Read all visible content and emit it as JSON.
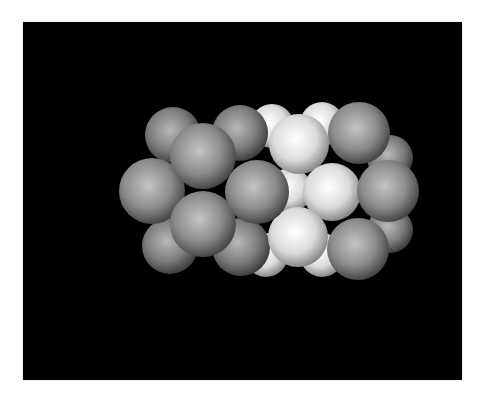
{
  "viewport": {
    "background": "#000000",
    "x": 23,
    "y": 22,
    "width": 439,
    "height": 358
  },
  "molecule": {
    "description": "space-filling cluster of spheres rendered on black background",
    "colors": {
      "gray": {
        "light": "#c4c4c4",
        "mid": "#8c8c8c",
        "dark": "#3a3a3a"
      },
      "white": {
        "light": "#ffffff",
        "mid": "#dcdcdc",
        "dark": "#7a7a7a"
      },
      "gray_back": {
        "light": "#b8b8b8",
        "mid": "#7e7e7e",
        "dark": "#333333"
      }
    },
    "atoms": [
      {
        "id": "back-white-top-left",
        "type": "white",
        "cx": 272,
        "cy": 126,
        "r": 22
      },
      {
        "id": "back-white-top-right",
        "type": "white",
        "cx": 322,
        "cy": 124,
        "r": 22
      },
      {
        "id": "back-white-bot-left",
        "type": "white",
        "cx": 266,
        "cy": 255,
        "r": 22
      },
      {
        "id": "back-white-bot-right",
        "type": "white",
        "cx": 322,
        "cy": 255,
        "r": 22
      },
      {
        "id": "back-white-center",
        "type": "white",
        "cx": 290,
        "cy": 190,
        "r": 22
      },
      {
        "id": "back-right-top",
        "type": "gray_back",
        "cx": 390,
        "cy": 158,
        "r": 23
      },
      {
        "id": "back-right-bottom",
        "type": "gray_back",
        "cx": 390,
        "cy": 230,
        "r": 23
      },
      {
        "id": "back-top-left",
        "type": "gray_back",
        "cx": 173,
        "cy": 135,
        "r": 28
      },
      {
        "id": "back-top-mid",
        "type": "gray_back",
        "cx": 240,
        "cy": 133,
        "r": 28
      },
      {
        "id": "back-bottom-left",
        "type": "gray_back",
        "cx": 170,
        "cy": 246,
        "r": 28
      },
      {
        "id": "back-bottom-mid",
        "type": "gray_back",
        "cx": 241,
        "cy": 247,
        "r": 29
      },
      {
        "id": "left-middle",
        "type": "gray",
        "cx": 152,
        "cy": 191,
        "r": 33
      },
      {
        "id": "white-top",
        "type": "white",
        "cx": 299,
        "cy": 144,
        "r": 30
      },
      {
        "id": "white-middle-right",
        "type": "white",
        "cx": 332,
        "cy": 192,
        "r": 29
      },
      {
        "id": "white-bottom",
        "type": "white",
        "cx": 298,
        "cy": 237,
        "r": 30
      },
      {
        "id": "gray-top-right",
        "type": "gray",
        "cx": 359,
        "cy": 133,
        "r": 31
      },
      {
        "id": "gray-right",
        "type": "gray",
        "cx": 388,
        "cy": 191,
        "r": 31
      },
      {
        "id": "gray-bottom-right",
        "type": "gray",
        "cx": 358,
        "cy": 249,
        "r": 31
      },
      {
        "id": "front-top-left",
        "type": "gray",
        "cx": 203,
        "cy": 156,
        "r": 33
      },
      {
        "id": "front-bottom-left",
        "type": "gray",
        "cx": 203,
        "cy": 224,
        "r": 33
      },
      {
        "id": "center-gray",
        "type": "gray",
        "cx": 257,
        "cy": 192,
        "r": 32
      }
    ]
  }
}
